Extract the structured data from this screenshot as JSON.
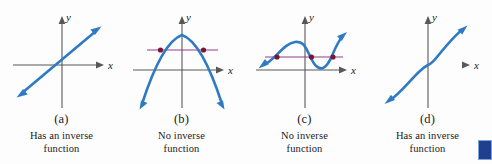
{
  "figure": {
    "background_color": "#fdfdfd",
    "curve_color": "#2e7bc4",
    "axis_color": "#58585a",
    "test_line_color": "#8e3f8e",
    "intersection_dot_color": "#7b1535",
    "tangent_green_color": "#5bbf8a",
    "corner_marker_color": "#1f3f8f"
  },
  "panels": [
    {
      "id": "a",
      "letter": "(a)",
      "caption_line1": "Has an inverse",
      "caption_line2": "function",
      "y_label": "y",
      "x_label": "x",
      "graph_type": "line",
      "horizontal_line_intersections": 0
    },
    {
      "id": "b",
      "letter": "(b)",
      "caption_line1": "No inverse",
      "caption_line2": "function",
      "y_label": "y",
      "x_label": "x",
      "graph_type": "downward-parabola",
      "horizontal_line_intersections": 2
    },
    {
      "id": "c",
      "letter": "(c)",
      "caption_line1": "No inverse",
      "caption_line2": "function",
      "y_label": "y",
      "x_label": "x",
      "graph_type": "wave-cubic",
      "horizontal_line_intersections": 3
    },
    {
      "id": "d",
      "letter": "(d)",
      "caption_line1": "Has an inverse",
      "caption_line2": "function",
      "y_label": "y",
      "x_label": "x",
      "graph_type": "increasing-cubic",
      "horizontal_line_intersections": 1
    }
  ],
  "corner_marker": {
    "label": ""
  }
}
